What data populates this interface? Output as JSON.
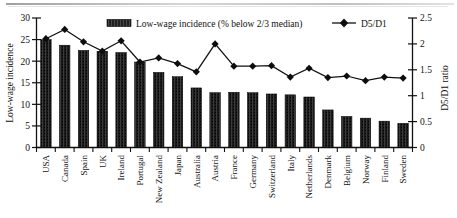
{
  "chart_data": {
    "type": "bar",
    "title": "",
    "xlabel": "",
    "ylabel": "Low-wage incidence",
    "y2label": "D5/D1 ratio",
    "ylim": [
      0,
      30
    ],
    "y2lim": [
      0,
      2.5
    ],
    "yticks": [
      "0",
      "5",
      "10",
      "15",
      "20",
      "25",
      "30"
    ],
    "y2ticks": [
      "0",
      "0.5",
      "1",
      "1.5",
      "2",
      "2.5"
    ],
    "grid": false,
    "legend_position": "top",
    "categories": [
      "USA",
      "Canada",
      "Spain",
      "UK",
      "Ireland",
      "Portugal",
      "New Zealand",
      "Japan",
      "Australia",
      "Austria",
      "France",
      "Germany",
      "Switzerland",
      "Italy",
      "Netherlands",
      "Denmark",
      "Belgium",
      "Norway",
      "Finland",
      "Sweden"
    ],
    "series": [
      {
        "name": "Low-wage incidence (% below  2/3 median)",
        "type": "bar",
        "axis": "left",
        "values": [
          25.0,
          23.7,
          22.5,
          22.3,
          22.0,
          19.8,
          17.4,
          16.4,
          13.8,
          12.7,
          12.8,
          12.7,
          12.4,
          12.2,
          11.7,
          8.7,
          7.2,
          6.8,
          6.1,
          5.6
        ]
      },
      {
        "name": "D5/D1",
        "type": "line",
        "axis": "right",
        "marker": "diamond",
        "values": [
          2.1,
          2.28,
          2.04,
          1.86,
          2.06,
          1.65,
          1.73,
          1.62,
          1.46,
          2.0,
          1.57,
          1.57,
          1.58,
          1.36,
          1.53,
          1.35,
          1.38,
          1.29,
          1.36,
          1.34
        ]
      }
    ]
  },
  "legend": {
    "bar_label": "Low-wage incidence (% below  2/3 median)",
    "line_label": "D5/D1"
  },
  "axes": {
    "left_title": "Low-wage incidence",
    "right_title": "D5/D1 ratio"
  }
}
